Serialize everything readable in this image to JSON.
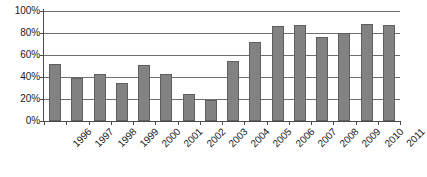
{
  "chart_data": {
    "type": "bar",
    "title": "",
    "subtitle": "",
    "xlabel": "",
    "ylabel": "",
    "categories": [
      "1996",
      "1997",
      "1998",
      "1999",
      "2000",
      "2001",
      "2002",
      "2003",
      "2004",
      "2005",
      "2006",
      "2007",
      "2008",
      "2009",
      "2010",
      "2011"
    ],
    "values": [
      52,
      39,
      43,
      35,
      51,
      43,
      25,
      19,
      55,
      72,
      86,
      87,
      76,
      80,
      88,
      87
    ],
    "series": [
      {
        "name": "",
        "values": [
          52,
          39,
          43,
          35,
          51,
          43,
          25,
          19,
          55,
          72,
          86,
          87,
          76,
          80,
          88,
          87
        ]
      }
    ],
    "ylim": [
      0,
      100
    ],
    "ytick_labels": [
      "0%",
      "20%",
      "40%",
      "60%",
      "80%",
      "100%"
    ],
    "ytick_values": [
      0,
      20,
      40,
      60,
      80,
      100
    ],
    "yaxis_unit": "%",
    "grid": true,
    "grid_axis": "y",
    "legend": false,
    "legend_position": "none",
    "annotations": [],
    "colors": {
      "bar_fill": "#828282",
      "bar_stroke": "#5f5f5f",
      "grid_line": "#6e6e6e",
      "axis_line": "#4a4a4a",
      "text": "#1a1a1a",
      "background": "#ffffff"
    }
  }
}
